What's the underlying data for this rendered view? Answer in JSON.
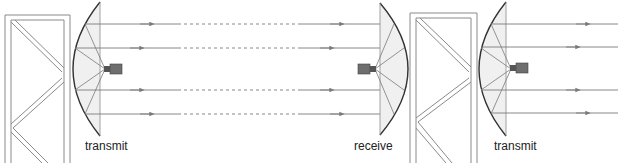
{
  "diagram": {
    "colors": {
      "tower_stroke": "#8a8a8a",
      "dish_stroke": "#333333",
      "dish_fill": "#f0f0f0",
      "ray_stroke": "#7a7a7a",
      "feed_fill": "#6e6e6e"
    },
    "labels": {
      "left_station": "transmit",
      "middle_station": "receive",
      "right_station": "transmit"
    },
    "stations": [
      {
        "role": "transmit",
        "dish_apex_x": 73,
        "feed_x": 110
      },
      {
        "role": "receive",
        "dish_apex_x": 408,
        "feed_x": 370
      },
      {
        "role": "transmit",
        "dish_apex_x": 478,
        "feed_x": 515
      }
    ],
    "beam_rows_y": [
      24,
      48,
      90,
      114
    ],
    "link_segments": {
      "solid_left_end_x": 178,
      "dashed_start_x": 178,
      "dashed_end_x": 300,
      "solid_right_start_x": 300
    }
  }
}
